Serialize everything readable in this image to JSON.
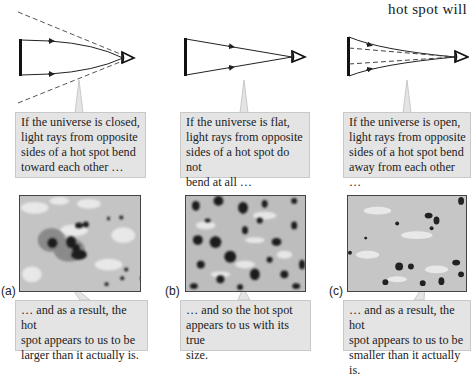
{
  "header": {
    "text": "hot spot will"
  },
  "panels": [
    {
      "id": "a",
      "label": "(a)",
      "case": "closed",
      "top_caption": "If the universe is closed, light rays from opposite sides of a hot spot bend toward each other …",
      "top_lines": [
        "If the universe is closed,",
        "light rays from opposite",
        "sides of a hot spot bend",
        "toward each other …"
      ],
      "bottom_lines": [
        "… and as a result, the hot",
        "spot appears to us to be",
        "larger than it actually is."
      ],
      "map_style": "large blotches"
    },
    {
      "id": "b",
      "label": "(b)",
      "case": "flat",
      "top_lines": [
        "If the universe is flat,",
        "light rays from opposite",
        "sides of a hot spot do not",
        "bend at all …"
      ],
      "bottom_lines": [
        "… and so the hot spot",
        "appears to us with its true",
        "size."
      ],
      "map_style": "medium spots"
    },
    {
      "id": "c",
      "label": "(c)",
      "case": "open",
      "top_lines": [
        "If the universe is open,",
        "light rays from opposite",
        "sides of a hot spot bend",
        "away from each other …"
      ],
      "bottom_lines": [
        "… and as a result, the hot",
        "spot appears to us to be",
        "smaller than it actually is."
      ],
      "map_style": "small spots"
    }
  ],
  "colors": {
    "callout_bg": "#e4e4e4",
    "callout_border": "#c9c9c9",
    "map_bg": "#c8c8c8",
    "spot_dark": "#1e1e1e",
    "spot_light": "#ececec"
  }
}
